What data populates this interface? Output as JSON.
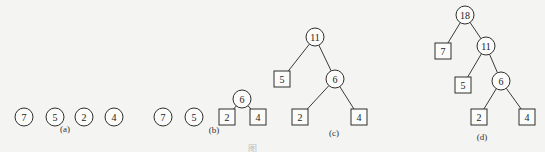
{
  "figure": {
    "caption_visible_fragment": "图",
    "colors": {
      "background": "#f4f4f2",
      "stroke": "#2e2e2e",
      "text": "#222222"
    }
  },
  "panels": [
    {
      "label": "(a)",
      "label_pos": [
        65,
        132
      ],
      "nodes": [
        {
          "id": "a7",
          "value": "7",
          "shape": "circle",
          "x": 24,
          "y": 117
        },
        {
          "id": "a5",
          "value": "5",
          "shape": "circle",
          "x": 55,
          "y": 117
        },
        {
          "id": "a2",
          "value": "2",
          "shape": "circle",
          "x": 84,
          "y": 117
        },
        {
          "id": "a4",
          "value": "4",
          "shape": "circle",
          "x": 114,
          "y": 117
        }
      ],
      "edges": []
    },
    {
      "label": "(b)",
      "label_pos": [
        214,
        133
      ],
      "nodes": [
        {
          "id": "b7",
          "value": "7",
          "shape": "circle",
          "x": 163,
          "y": 117
        },
        {
          "id": "b5",
          "value": "5",
          "shape": "circle",
          "x": 194,
          "y": 117
        },
        {
          "id": "b6",
          "value": "6",
          "shape": "circle",
          "x": 242,
          "y": 99
        },
        {
          "id": "b2",
          "value": "2",
          "shape": "square",
          "x": 227,
          "y": 117
        },
        {
          "id": "b4",
          "value": "4",
          "shape": "square",
          "x": 258,
          "y": 117
        }
      ],
      "edges": [
        [
          "b6",
          "b2"
        ],
        [
          "b6",
          "b4"
        ]
      ]
    },
    {
      "label": "(c)",
      "label_pos": [
        334,
        136
      ],
      "nodes": [
        {
          "id": "c11",
          "value": "11",
          "shape": "circle",
          "x": 315,
          "y": 37
        },
        {
          "id": "c5",
          "value": "5",
          "shape": "square",
          "x": 282,
          "y": 79
        },
        {
          "id": "c6",
          "value": "6",
          "shape": "circle",
          "x": 335,
          "y": 79
        },
        {
          "id": "c2",
          "value": "2",
          "shape": "square",
          "x": 300,
          "y": 117
        },
        {
          "id": "c4",
          "value": "4",
          "shape": "square",
          "x": 359,
          "y": 117
        }
      ],
      "edges": [
        [
          "c11",
          "c5"
        ],
        [
          "c11",
          "c6"
        ],
        [
          "c6",
          "c2"
        ],
        [
          "c6",
          "c4"
        ]
      ]
    },
    {
      "label": "(d)",
      "label_pos": [
        482,
        140
      ],
      "nodes": [
        {
          "id": "d18",
          "value": "18",
          "shape": "circle",
          "x": 465,
          "y": 15
        },
        {
          "id": "d7",
          "value": "7",
          "shape": "square",
          "x": 443,
          "y": 51
        },
        {
          "id": "d11",
          "value": "11",
          "shape": "circle",
          "x": 486,
          "y": 46
        },
        {
          "id": "d5",
          "value": "5",
          "shape": "square",
          "x": 463,
          "y": 85
        },
        {
          "id": "d6",
          "value": "6",
          "shape": "circle",
          "x": 501,
          "y": 81
        },
        {
          "id": "d2",
          "value": "2",
          "shape": "square",
          "x": 479,
          "y": 117
        },
        {
          "id": "d4",
          "value": "4",
          "shape": "square",
          "x": 527,
          "y": 117
        }
      ],
      "edges": [
        [
          "d18",
          "d7"
        ],
        [
          "d18",
          "d11"
        ],
        [
          "d11",
          "d5"
        ],
        [
          "d11",
          "d6"
        ],
        [
          "d6",
          "d2"
        ],
        [
          "d6",
          "d4"
        ]
      ]
    }
  ],
  "geometry": {
    "circle_radius": 9,
    "square_size": 16
  }
}
